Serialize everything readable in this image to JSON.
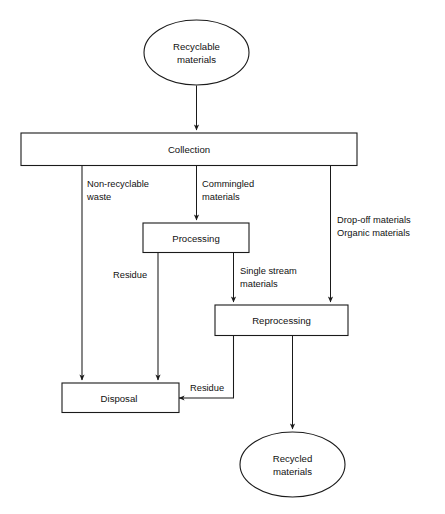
{
  "diagram": {
    "type": "flowchart",
    "colors": {
      "background": "#ffffff",
      "stroke": "#1a1a1a",
      "text": "#111111",
      "node_fill": "#ffffff"
    },
    "nodes": [
      {
        "id": "recyclable-materials",
        "shape": "ellipse",
        "line1": "Recyclable",
        "line2": "materials"
      },
      {
        "id": "collection",
        "shape": "rectangle",
        "label": "Collection"
      },
      {
        "id": "processing",
        "shape": "rectangle",
        "label": "Processing"
      },
      {
        "id": "reprocessing",
        "shape": "rectangle",
        "label": "Reprocessing"
      },
      {
        "id": "disposal",
        "shape": "rectangle",
        "label": "Disposal"
      },
      {
        "id": "recycled-materials",
        "shape": "ellipse",
        "line1": "Recycled",
        "line2": "materials"
      }
    ],
    "edge_labels": [
      {
        "id": "non-recyclable-waste",
        "line1": "Non-recyclable",
        "line2": "waste",
        "from": "collection",
        "to": "disposal"
      },
      {
        "id": "commingled-materials",
        "line1": "Commingled",
        "line2": "materials",
        "from": "collection",
        "to": "processing"
      },
      {
        "id": "drop-off-organic-materials",
        "line1": "Drop-off materials",
        "line2": "Organic materials",
        "from": "collection",
        "to": "reprocessing"
      },
      {
        "id": "residue-processing",
        "line1": "Residue",
        "from": "processing",
        "to": "disposal"
      },
      {
        "id": "single-stream-materials",
        "line1": "Single stream",
        "line2": "materials",
        "from": "processing",
        "to": "reprocessing"
      },
      {
        "id": "residue-reprocessing",
        "line1": "Residue",
        "from": "reprocessing",
        "to": "disposal"
      }
    ]
  }
}
